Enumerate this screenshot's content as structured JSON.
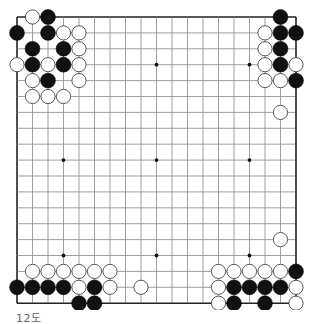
{
  "diagram": {
    "caption": "12도",
    "board_size": 19,
    "star_points": [
      [
        3,
        3
      ],
      [
        3,
        9
      ],
      [
        3,
        15
      ],
      [
        9,
        3
      ],
      [
        9,
        9
      ],
      [
        9,
        15
      ],
      [
        15,
        3
      ],
      [
        15,
        9
      ],
      [
        15,
        15
      ]
    ],
    "colors": {
      "background": "#ffffff",
      "grid": "#888888",
      "border": "#222222",
      "black_stone": "#111111",
      "white_stone": "#ffffff",
      "white_outline": "#444444"
    },
    "stones": {
      "black": [
        [
          0,
          2
        ],
        [
          1,
          0
        ],
        [
          1,
          2
        ],
        [
          2,
          1
        ],
        [
          2,
          3
        ],
        [
          3,
          1
        ],
        [
          3,
          3
        ],
        [
          4,
          2
        ],
        [
          0,
          17
        ],
        [
          1,
          17
        ],
        [
          1,
          18
        ],
        [
          2,
          17
        ],
        [
          3,
          17
        ],
        [
          4,
          18
        ],
        [
          17,
          0
        ],
        [
          17,
          1
        ],
        [
          17,
          2
        ],
        [
          17,
          3
        ],
        [
          17,
          5
        ],
        [
          18,
          4
        ],
        [
          18,
          5
        ],
        [
          16,
          18
        ],
        [
          17,
          14
        ],
        [
          17,
          15
        ],
        [
          17,
          16
        ],
        [
          17,
          17
        ],
        [
          18,
          14
        ],
        [
          18,
          16
        ]
      ],
      "white": [
        [
          0,
          1
        ],
        [
          1,
          3
        ],
        [
          1,
          4
        ],
        [
          2,
          4
        ],
        [
          3,
          0
        ],
        [
          3,
          2
        ],
        [
          3,
          4
        ],
        [
          4,
          1
        ],
        [
          4,
          4
        ],
        [
          5,
          1
        ],
        [
          5,
          2
        ],
        [
          5,
          3
        ],
        [
          1,
          16
        ],
        [
          2,
          16
        ],
        [
          3,
          16
        ],
        [
          3,
          18
        ],
        [
          4,
          16
        ],
        [
          4,
          17
        ],
        [
          6,
          17
        ],
        [
          16,
          1
        ],
        [
          16,
          2
        ],
        [
          16,
          3
        ],
        [
          16,
          4
        ],
        [
          16,
          5
        ],
        [
          16,
          6
        ],
        [
          17,
          4
        ],
        [
          17,
          6
        ],
        [
          17,
          8
        ],
        [
          14,
          17
        ],
        [
          16,
          13
        ],
        [
          16,
          14
        ],
        [
          16,
          15
        ],
        [
          16,
          16
        ],
        [
          16,
          17
        ],
        [
          17,
          13
        ],
        [
          17,
          18
        ],
        [
          18,
          13
        ],
        [
          18,
          18
        ]
      ]
    }
  }
}
